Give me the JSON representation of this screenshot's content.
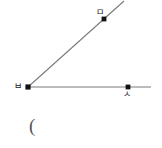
{
  "figure": {
    "type": "angle-diagram",
    "background_color": "#ffffff",
    "stroke_color": "#7a7a7a",
    "point_color": "#111111",
    "text_color": "#1a1a1a",
    "paren_color": "#555555",
    "vertex": {
      "label": "ㅂ",
      "x": 28,
      "y": 87
    },
    "rays": [
      {
        "name": "upper-ray",
        "from_x": 28,
        "from_y": 87,
        "to_x": 124,
        "to_y": 1,
        "point": {
          "label": "ㅁ",
          "x": 104,
          "y": 19
        }
      },
      {
        "name": "right-ray",
        "from_x": 28,
        "from_y": 87,
        "to_x": 151,
        "to_y": 87,
        "point": {
          "label": "ㅅ",
          "x": 128,
          "y": 87
        }
      }
    ],
    "annotation": {
      "name": "open-paren",
      "text": "(",
      "x": 29,
      "y": 116
    }
  }
}
